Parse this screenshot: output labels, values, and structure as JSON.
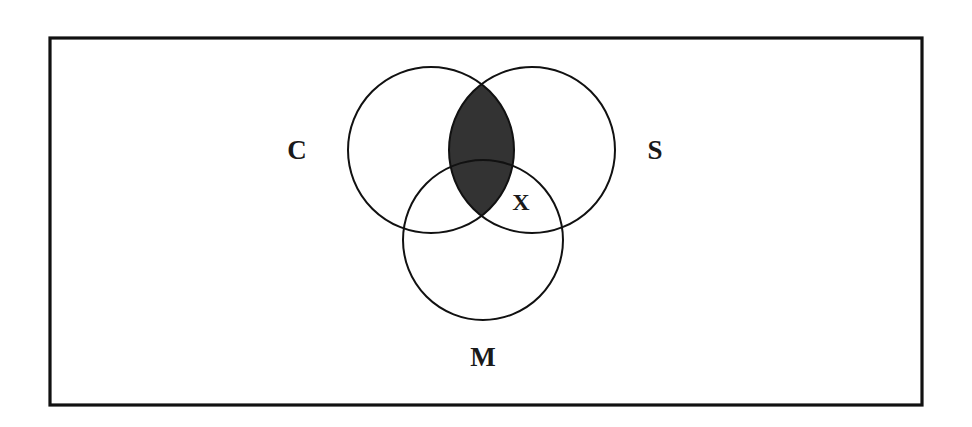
{
  "figure": {
    "background_color": "#ffffff",
    "stroke_color": "#111111",
    "shade_color": "#333333",
    "frame": {
      "x": 50,
      "y": 38,
      "width": 872,
      "height": 367,
      "stroke_width": 3.2
    },
    "circles": [
      {
        "id": "C",
        "label": "C",
        "cx": 431,
        "cy": 150,
        "r": 83,
        "label_x": 297,
        "label_y": 150
      },
      {
        "id": "S",
        "label": "S",
        "cx": 532,
        "cy": 150,
        "r": 83,
        "label_x": 655,
        "label_y": 150
      },
      {
        "id": "M",
        "label": "M",
        "cx": 483,
        "cy": 240,
        "r": 80,
        "label_x": 483,
        "label_y": 357
      }
    ],
    "shaded_regions": [
      {
        "id": "C-and-S",
        "description": "intersection of C and S",
        "color": "#333333"
      }
    ],
    "marks": [
      {
        "id": "X",
        "label": "X",
        "x": 521,
        "y": 202
      }
    ]
  }
}
